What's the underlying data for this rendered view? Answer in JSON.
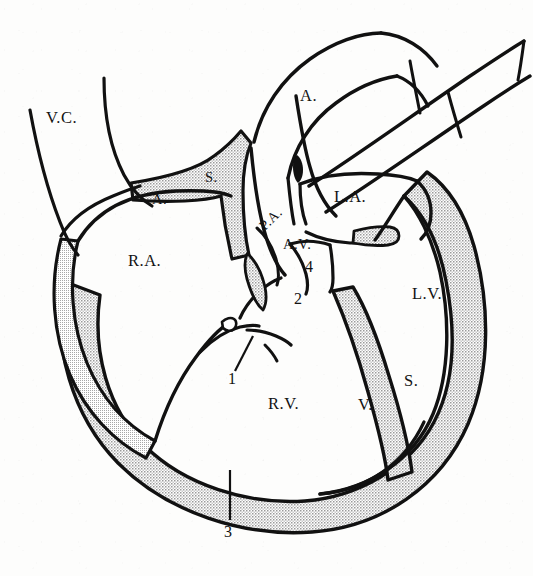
{
  "figure": {
    "kind": "anatomical-line-diagram",
    "background_color": "#fdfdfc",
    "ink_color": "#111111",
    "stipple_color": "#b9b9b9"
  },
  "labels": {
    "vena_cava": "V.C.",
    "aorta": "A.",
    "atrial_a": "A.",
    "atrial_s": "S.",
    "pulmonary_artery": "P.A.",
    "left_atrium": "L.A.",
    "atrioventricular": "A.V.",
    "right_atrium": "R.A.",
    "left_ventricle": "L.V.",
    "right_ventricle": "R.V.",
    "ventricular_v": "V.",
    "ventricular_s": "S.",
    "callout_1": "1",
    "callout_2": "2",
    "callout_3": "3",
    "callout_4": "4"
  },
  "callouts": [
    {
      "id": "1",
      "text": "1",
      "has_leader_line": true
    },
    {
      "id": "2",
      "text": "2",
      "has_leader_line": false
    },
    {
      "id": "3",
      "text": "3",
      "has_leader_line": true
    },
    {
      "id": "4",
      "text": "4",
      "has_leader_line": false
    }
  ],
  "structures": [
    {
      "name": "vena-cava",
      "label": "V.C."
    },
    {
      "name": "aorta",
      "label": "A."
    },
    {
      "name": "pulmonary-artery",
      "label": "P.A."
    },
    {
      "name": "right-atrium",
      "label": "R.A."
    },
    {
      "name": "left-atrium",
      "label": "L.A."
    },
    {
      "name": "right-ventricle",
      "label": "R.V."
    },
    {
      "name": "left-ventricle",
      "label": "L.V."
    },
    {
      "name": "atrial-septum",
      "label": "A. S."
    },
    {
      "name": "ventricular-septum",
      "label": "V. S."
    },
    {
      "name": "atrioventricular-valve",
      "label": "A.V."
    }
  ]
}
